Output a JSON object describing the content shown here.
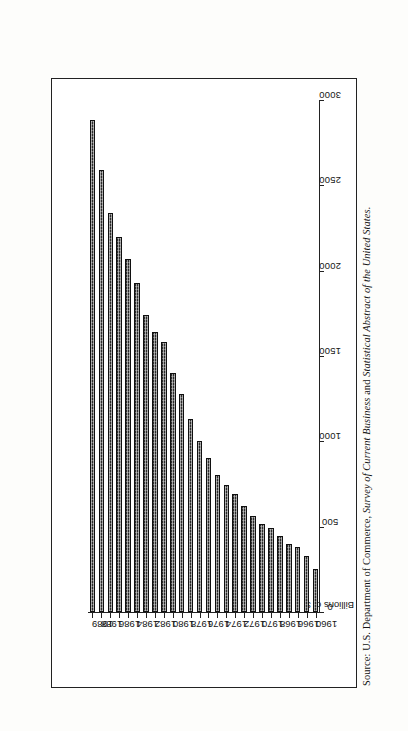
{
  "figure": {
    "value_axis_title": "Billions of $",
    "source_lead": "Source: U.S. Department of Commerce, ",
    "source_italic_1": "Survey of Current Business",
    "source_mid": " and ",
    "source_italic_2": "Statistical Abstract of the United States.",
    "orientation": "rotated-90-ccw"
  },
  "chart_data": {
    "type": "bar",
    "title": "",
    "subtitle": "",
    "xlabel": "",
    "ylabel": "Billions of $",
    "orientation": "horizontal-bars-printed-sideways",
    "grid": false,
    "legend": null,
    "ylim": [
      0,
      3000
    ],
    "value_ticks": [
      0,
      500,
      1000,
      1500,
      2000,
      2500,
      3000
    ],
    "value_tick_labels": [
      "0",
      "500",
      "1000",
      "1500",
      "2000",
      "2500",
      "3000"
    ],
    "category_tick_labels": [
      "1960",
      "1966",
      "1968",
      "1970",
      "1972",
      "1974",
      "1976",
      "1978",
      "1980",
      "1982",
      "1984",
      "1986",
      "1988",
      "1989"
    ],
    "categories": [
      "1960",
      "1965",
      "1966",
      "1967",
      "1968",
      "1969",
      "1970",
      "1971",
      "1972",
      "1973",
      "1974",
      "1975",
      "1976",
      "1977",
      "1978",
      "1979",
      "1980",
      "1981",
      "1982",
      "1983",
      "1984",
      "1985",
      "1986",
      "1987",
      "1988",
      "1989"
    ],
    "values": [
      250,
      330,
      380,
      400,
      445,
      490,
      515,
      560,
      620,
      690,
      745,
      800,
      900,
      1000,
      1130,
      1280,
      1400,
      1580,
      1640,
      1740,
      1930,
      2070,
      2200,
      2340,
      2590,
      2880
    ],
    "bar_color": "#2b2b2b",
    "bar_fill": "cross-hatch-halftone"
  }
}
